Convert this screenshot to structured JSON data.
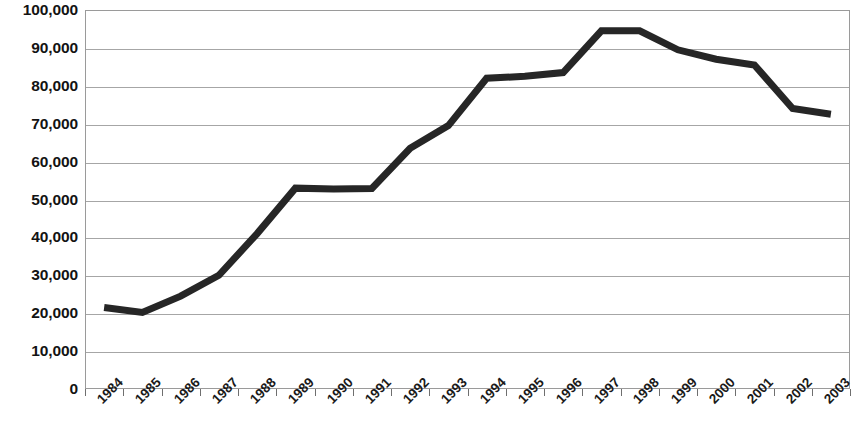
{
  "chart_data": {
    "type": "line",
    "title": "",
    "subtitle": "",
    "xlabel": "",
    "ylabel": "",
    "grid": true,
    "legend": false,
    "legend_position": "none",
    "line_color": "#262626",
    "line_width": 7,
    "categories": [
      "1984",
      "1985",
      "1986",
      "1987",
      "1988",
      "1989",
      "1990",
      "1991",
      "1992",
      "1993",
      "1994",
      "1995",
      "1996",
      "1997",
      "1998",
      "1999",
      "2000",
      "2001",
      "2002",
      "2003"
    ],
    "values": [
      21500,
      20200,
      24500,
      30000,
      41000,
      53000,
      52800,
      52900,
      63500,
      69500,
      82000,
      82500,
      83500,
      94500,
      94500,
      89500,
      87000,
      85500,
      74000,
      72500
    ],
    "ylim": [
      0,
      100000
    ],
    "ytick_values": [
      0,
      10000,
      20000,
      30000,
      40000,
      50000,
      60000,
      70000,
      80000,
      90000,
      100000
    ],
    "ytick_labels": [
      "0",
      "10,000",
      "20,000",
      "30,000",
      "40,000",
      "50,000",
      "60,000",
      "70,000",
      "80,000",
      "90,000",
      "100,000"
    ]
  }
}
